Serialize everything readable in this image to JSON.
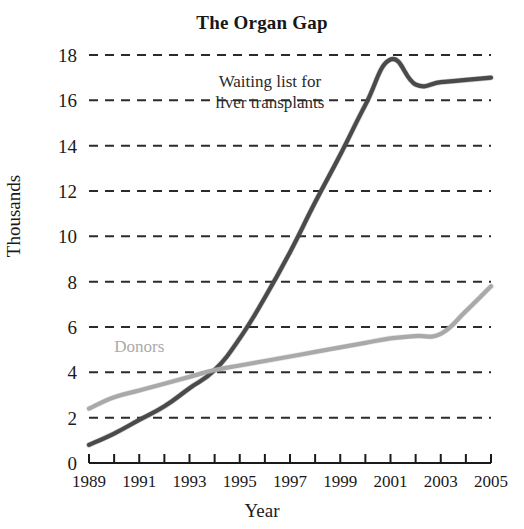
{
  "chart_data": {
    "type": "line",
    "title": "The Organ Gap",
    "xlabel": "Year",
    "ylabel": "Thousands",
    "x": [
      1989,
      1990,
      1991,
      1992,
      1993,
      1994,
      1995,
      1996,
      1997,
      1998,
      1999,
      2000,
      2001,
      2002,
      2003,
      2004,
      2005
    ],
    "xlim": [
      1989,
      2005
    ],
    "ylim": [
      0,
      18
    ],
    "ytick_values": [
      0,
      2,
      4,
      6,
      8,
      10,
      12,
      14,
      16,
      18
    ],
    "ytick_labels": [
      "0",
      "2",
      "4",
      "6",
      "8",
      "10",
      "12",
      "14",
      "16",
      "18"
    ],
    "xtick_values": [
      1989,
      1991,
      1993,
      1995,
      1997,
      1999,
      2001,
      2003,
      2005
    ],
    "xtick_labels": [
      "1989",
      "1991",
      "1993",
      "1995",
      "1997",
      "1999",
      "2001",
      "2003",
      "2005"
    ],
    "xtick_minor_values": [
      1990,
      1992,
      1994,
      1996,
      1998,
      2000,
      2002,
      2004
    ],
    "grid": "horizontal-dashed",
    "legend_position": "inline-annotations",
    "series": [
      {
        "name": "Waiting list for liver transplants",
        "color": "#4a4a4a",
        "label_lines": [
          "Waiting list for",
          "liver transplants"
        ],
        "values": [
          0.8,
          1.3,
          1.9,
          2.5,
          3.3,
          4.1,
          5.5,
          7.3,
          9.3,
          11.5,
          13.6,
          15.8,
          17.8,
          16.7,
          16.8,
          16.9,
          17.0
        ]
      },
      {
        "name": "Donors",
        "color": "#a9a9a9",
        "label_lines": [
          "Donors"
        ],
        "values": [
          2.4,
          2.9,
          3.2,
          3.5,
          3.8,
          4.1,
          4.3,
          4.5,
          4.7,
          4.9,
          5.1,
          5.3,
          5.5,
          5.6,
          5.7,
          6.7,
          7.8
        ]
      }
    ],
    "annotations": [
      {
        "text": "Waiting list for liver transplants",
        "x": 1996.2,
        "y": 16.6
      },
      {
        "text": "Donors",
        "x": 1991.0,
        "y": 4.9
      }
    ]
  }
}
